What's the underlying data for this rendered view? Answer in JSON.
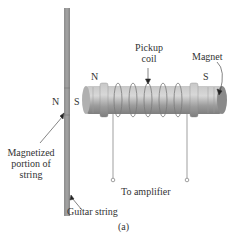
{
  "figure": {
    "labels": {
      "string_north": "N",
      "string_south": "S",
      "magnet_north": "N",
      "magnet_south": "S",
      "pickup_coil": "Pickup coil",
      "pickup_coil_line1": "Pickup",
      "pickup_coil_line2": "coil",
      "magnet": "Magnet",
      "magnetized_portion_line1": "Magnetized",
      "magnetized_portion_line2": "portion of",
      "magnetized_portion_line3": "string",
      "to_amplifier": "To amplifier",
      "guitar_string": "Guitar string",
      "panel": "(a)"
    },
    "colors": {
      "string": "#9a9a9a",
      "string_magnetized": "#8a8a8a",
      "magnet_body": "#a8a8a8",
      "magnet_highlight": "#d0d0d0",
      "coil_wire": "#888888",
      "text": "#333333"
    }
  }
}
